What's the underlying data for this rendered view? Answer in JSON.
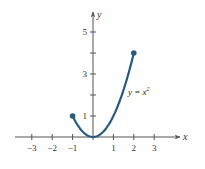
{
  "chart_data": {
    "type": "line",
    "title": "",
    "xlabel": "x",
    "ylabel": "y",
    "xlim": [
      -3.5,
      3.7
    ],
    "ylim": [
      -0.3,
      5.8
    ],
    "grid": false,
    "x_ticks": [
      -3,
      -2,
      -1,
      1,
      2,
      3
    ],
    "x_tick_labels": [
      "−3",
      "−2",
      "−1",
      "1",
      "2",
      "3"
    ],
    "y_ticks": [
      1,
      2,
      3,
      4,
      5
    ],
    "y_tick_labels": [
      "1",
      "",
      "3",
      "",
      "5"
    ],
    "series": [
      {
        "name": "y = x^2",
        "function": "x^2",
        "domain": [
          -1,
          2
        ],
        "x": [
          -1,
          -0.5,
          0,
          0.5,
          1,
          1.5,
          2
        ],
        "y": [
          1,
          0.25,
          0,
          0.25,
          1,
          2.25,
          4
        ],
        "color": "#2a5a7e",
        "endpoints": [
          {
            "x": -1,
            "y": 1,
            "marker": "filled-dot"
          },
          {
            "x": 2,
            "y": 4,
            "marker": "filled-dot"
          }
        ]
      }
    ],
    "annotations": [
      {
        "text": "y = x",
        "superscript": "2",
        "x": 1.6,
        "y": 2.5
      }
    ]
  },
  "labels": {
    "x_axis": "x",
    "y_axis": "y",
    "curve_main": "y = x",
    "curve_sup": "2"
  },
  "colors": {
    "curve": "#2a5a7e",
    "axis": "#555555"
  }
}
